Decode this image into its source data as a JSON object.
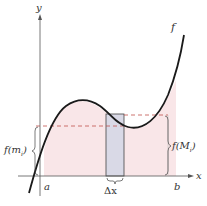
{
  "diagram": {
    "axis_labels": {
      "x": "x",
      "y": "y"
    },
    "function_label": "f",
    "interval_labels": {
      "a": "a",
      "b": "b"
    },
    "width_label": "Δx",
    "min_label": "f(m",
    "min_sub": "i",
    "max_label": "f(M",
    "max_sub": "i",
    "close_paren": ")",
    "colors": {
      "curve": "#1a1a1a",
      "shade": "#f9e6e8",
      "rect_fill": "#d9d9e6",
      "dashed": "#c0504d",
      "axis": "#555555"
    }
  }
}
